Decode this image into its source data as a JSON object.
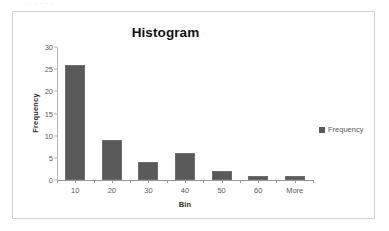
{
  "clipped_text": "·  ·  ·       ·         ·",
  "chart": {
    "title": "Histogram",
    "xlabel": "Bin",
    "ylabel": "Frequency",
    "legend": {
      "entries": [
        {
          "label": "Frequency",
          "color": "#5a5a5a"
        }
      ],
      "position": "right"
    },
    "colors": {
      "bar_fill": "#5a5a5a",
      "bar_border": "#6e6e6e",
      "axis": "#9a9a9a",
      "tick_text": "#595959",
      "title_text": "#111111",
      "frame_border": "#d0d0d0",
      "background": "#ffffff"
    },
    "y_ticks": [
      "0",
      "5",
      "10",
      "15",
      "20",
      "25",
      "30"
    ],
    "x_ticks": [
      "10",
      "20",
      "30",
      "40",
      "50",
      "60",
      "More"
    ]
  },
  "chart_data": {
    "type": "bar",
    "title": "Histogram",
    "xlabel": "Bin",
    "ylabel": "Frequency",
    "categories": [
      "10",
      "20",
      "30",
      "40",
      "50",
      "60",
      "More"
    ],
    "values": [
      26,
      9,
      4,
      6,
      2,
      1,
      1
    ],
    "series": [
      {
        "name": "Frequency",
        "values": [
          26,
          9,
          4,
          6,
          2,
          1,
          1
        ]
      }
    ],
    "ylim": [
      0,
      30
    ],
    "yticks": [
      0,
      5,
      10,
      15,
      20,
      25,
      30
    ],
    "grid": false,
    "legend_position": "right"
  }
}
